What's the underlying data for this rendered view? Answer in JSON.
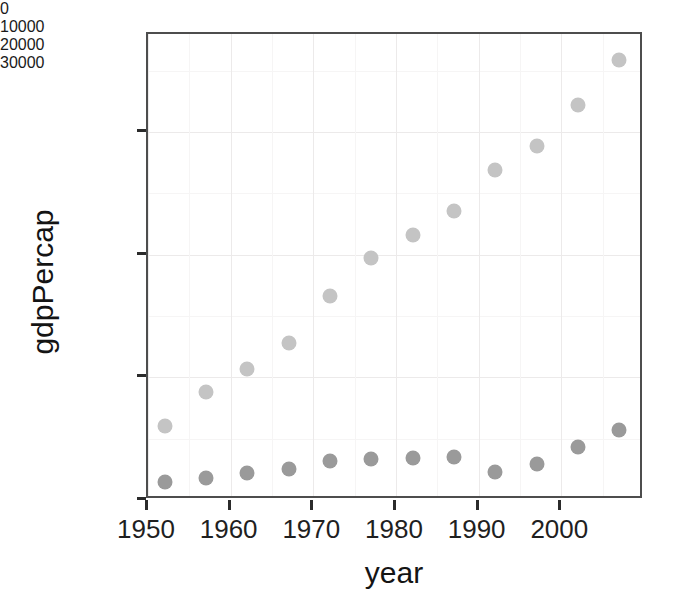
{
  "page": {
    "fragment_text": "166"
  },
  "chart_data": {
    "type": "scatter",
    "title": "",
    "xlabel": "year",
    "ylabel": "gdpPercap",
    "xlim": [
      1950.0,
      2010.0
    ],
    "ylim": [
      0,
      38000
    ],
    "grid": true,
    "legend": "none",
    "x_ticks": [
      1950,
      1960,
      1970,
      1980,
      1990,
      2000
    ],
    "x_tick_labels": [
      "1950",
      "1960",
      "1970",
      "1980",
      "1990",
      "2000"
    ],
    "y_ticks": [
      0,
      10000,
      20000,
      30000
    ],
    "y_tick_labels": [
      "0",
      "10000",
      "20000",
      "30000"
    ],
    "x_minor_ticks": [
      1955,
      1965,
      1975,
      1985,
      1995,
      2005
    ],
    "y_minor_ticks": [
      5000,
      15000,
      25000,
      35000
    ],
    "x": [
      1952,
      1957,
      1962,
      1967,
      1972,
      1977,
      1982,
      1987,
      1992,
      1997,
      2002,
      2007
    ],
    "series": [
      {
        "name": "upper-series",
        "color": "#c4c4c4",
        "marker": "circle",
        "values": [
          6000,
          8800,
          10700,
          12800,
          16600,
          19700,
          21600,
          23600,
          26900,
          28900,
          32200,
          35900
        ]
      },
      {
        "name": "lower-series",
        "color": "#9a9a9a",
        "marker": "circle",
        "values": [
          1500,
          1800,
          2200,
          2550,
          3150,
          3350,
          3450,
          3500,
          2300,
          2950,
          4350,
          5700
        ]
      }
    ]
  },
  "colors": {
    "panel_border": "#4d4d4d",
    "grid_major": "#eceaea",
    "grid_minor": "#f6f5f5",
    "text": "#1f1f1f",
    "background": "#ffffff"
  }
}
